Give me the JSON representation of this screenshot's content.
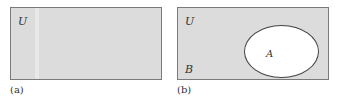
{
  "panels": [
    {
      "id": "a",
      "caption": "(a)",
      "labels": {
        "universe": "U"
      }
    },
    {
      "id": "b",
      "caption": "(b)",
      "labels": {
        "universe": "U",
        "region": "B",
        "set": "A"
      }
    }
  ],
  "colors": {
    "shaded": "#dcdcdc",
    "set_fill": "#ffffff",
    "border": "#7a7a7a"
  }
}
